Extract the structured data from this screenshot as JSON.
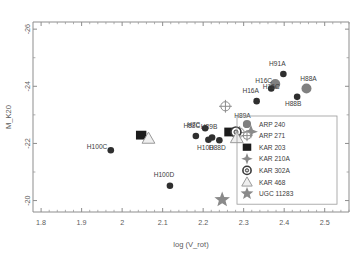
{
  "chart_data": {
    "type": "scatter",
    "title": "",
    "xlabel": "log (V_rot)",
    "ylabel": "M_K20",
    "xlim": [
      1.78,
      2.56
    ],
    "ylim": [
      -19.6,
      -26.25
    ],
    "y_inverted": true,
    "grid": false,
    "xticks": [
      1.8,
      1.9,
      2.0,
      2.1,
      2.2,
      2.3,
      2.4,
      2.5
    ],
    "xticklabels": [
      "1.8",
      "1.9",
      "2",
      "2.1",
      "2.2",
      "2.3",
      "2.4",
      "2.5"
    ],
    "yticks": [
      -26,
      -24,
      -22,
      -20
    ],
    "yticklabels": [
      "-26",
      "-24",
      "-22",
      "-20"
    ],
    "legend_position": "lower right",
    "legend": [
      {
        "label": "ARP 240",
        "marker": "circle-filled",
        "color": "#808080"
      },
      {
        "label": "ARP 271",
        "marker": "circle-crosshair",
        "color": "#8c8c8c"
      },
      {
        "label": "KAR 203",
        "marker": "square-filled",
        "color": "#1c1c1c"
      },
      {
        "label": "KAR 210A",
        "marker": "four-point-star",
        "color": "#8a8a8a"
      },
      {
        "label": "KAR 302A",
        "marker": "circle-donut",
        "color": "#d9d9d9"
      },
      {
        "label": "KAR 468",
        "marker": "triangle-open",
        "color": "#b8b8b8"
      },
      {
        "label": "UGC 11283",
        "marker": "five-point-star",
        "color": "#8a8a8a"
      }
    ],
    "series": [
      {
        "name": "ARP 240",
        "marker": "circle-filled",
        "color": "#808080",
        "points": [
          {
            "label": "H16C",
            "x": 2.378,
            "y": -24.08,
            "label_dx": -20,
            "label_dy": -1
          },
          {
            "label": "H88A",
            "x": 2.455,
            "y": -23.92,
            "label_dx": 2,
            "label_dy": -8
          }
        ]
      },
      {
        "name": "Companions",
        "marker": "circle-small",
        "color": "#2f2f2f",
        "points": [
          {
            "label": "H91A",
            "x": 2.398,
            "y": -24.43,
            "label_dx": -6,
            "label_dy": -8
          },
          {
            "label": "H16C",
            "x": 2.368,
            "y": -23.92,
            "label_dx": 0,
            "label_dy": 0
          },
          {
            "label": "H88B",
            "x": 2.432,
            "y": -23.63,
            "label_dx": -4,
            "label_dy": 9
          },
          {
            "label": "H16A",
            "x": 2.332,
            "y": -23.48,
            "label_dx": -6,
            "label_dy": -8
          },
          {
            "label": "H7C",
            "x": 2.205,
            "y": -22.53,
            "label_dx": -18,
            "label_dy": -1
          },
          {
            "label": "H89A",
            "x": 2.307,
            "y": -22.66,
            "label_dx": -4,
            "label_dy": -7
          },
          {
            "label": "H88C",
            "x": 2.182,
            "y": -22.26,
            "label_dx": -4,
            "label_dy": -8
          },
          {
            "label": "H89B",
            "x": 2.222,
            "y": -22.21,
            "label_dx": -3,
            "label_dy": -8
          },
          {
            "label": "H10D",
            "x": 2.213,
            "y": -22.13,
            "label_dx": -3,
            "label_dy": 10
          },
          {
            "label": "H88D",
            "x": 2.24,
            "y": -22.11,
            "label_dx": -2,
            "label_dy": 10
          },
          {
            "label": "H100C",
            "x": 1.972,
            "y": -21.76,
            "label_dx": -24,
            "label_dy": -1
          },
          {
            "label": "H100D",
            "x": 2.118,
            "y": -20.52,
            "label_dx": -6,
            "label_dy": -9
          }
        ]
      },
      {
        "name": "ARP 271",
        "marker": "circle-crosshair",
        "color": "#8c8c8c",
        "points": [
          {
            "label": "",
            "x": 2.255,
            "y": -23.3
          },
          {
            "label": "",
            "x": 2.29,
            "y": -22.38
          }
        ]
      },
      {
        "name": "KAR 203",
        "marker": "square-filled",
        "color": "#1c1c1c",
        "points": [
          {
            "label": "",
            "x": 2.047,
            "y": -22.29
          },
          {
            "label": "",
            "x": 2.265,
            "y": -22.4
          }
        ]
      },
      {
        "name": "KAR 210A",
        "marker": "four-point-star",
        "color": "#8a8a8a",
        "points": [
          {
            "label": "",
            "x": 2.318,
            "y": -22.41
          }
        ]
      },
      {
        "name": "KAR 302A",
        "marker": "circle-donut",
        "color": "#d9d9d9",
        "points": [
          {
            "label": "",
            "x": 2.281,
            "y": -22.4
          }
        ]
      },
      {
        "name": "KAR 468",
        "marker": "triangle-open",
        "color": "#bdbdbd",
        "points": [
          {
            "label": "",
            "x": 2.065,
            "y": -22.18
          },
          {
            "label": "",
            "x": 2.283,
            "y": -22.2
          }
        ]
      },
      {
        "name": "UGC 11283",
        "marker": "five-point-star",
        "color": "#8a8a8a",
        "points": [
          {
            "label": "",
            "x": 2.247,
            "y": -20.03
          }
        ]
      }
    ]
  }
}
